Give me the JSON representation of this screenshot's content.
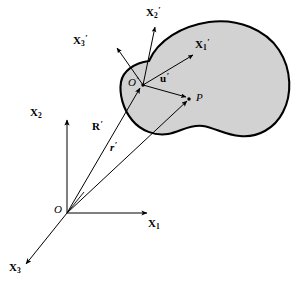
{
  "figure": {
    "type": "vector-diagram",
    "colors": {
      "body_fill": "#d2d2d2",
      "body_outline": "#000000",
      "axis": "#000000",
      "vector": "#000000",
      "background": "#ffffff"
    }
  },
  "labels": {
    "local_axis_1": {
      "symbol": "X",
      "sub": "1",
      "prime": "′"
    },
    "local_axis_2": {
      "symbol": "X",
      "sub": "2",
      "prime": "′"
    },
    "local_axis_3": {
      "symbol": "X",
      "sub": "3",
      "prime": "′"
    },
    "global_axis_1": {
      "symbol": "X",
      "sub": "1",
      "prime": ""
    },
    "global_axis_2": {
      "symbol": "X",
      "sub": "2",
      "prime": ""
    },
    "global_axis_3": {
      "symbol": "X",
      "sub": "3",
      "prime": ""
    },
    "global_origin": {
      "symbol": "O",
      "prime": ""
    },
    "local_origin": {
      "symbol": "O",
      "prime": "′"
    },
    "point": {
      "symbol": "P",
      "prime": ""
    },
    "vector_u": {
      "symbol": "u",
      "prime": "′"
    },
    "vector_R": {
      "symbol": "R",
      "prime": "′"
    },
    "vector_r": {
      "symbol": "r",
      "prime": "′"
    }
  },
  "geometry": {
    "global_origin_xy": [
      67,
      213
    ],
    "local_origin_xy": [
      143,
      85
    ],
    "point_P_xy": [
      190,
      99
    ],
    "axis_X1_end_xy": [
      150,
      213
    ],
    "axis_X2_end_xy": [
      67,
      117
    ],
    "axis_X3_end_xy": [
      22,
      268
    ],
    "local_X1_end_xy": [
      196,
      52
    ],
    "local_X2_end_xy": [
      156,
      23
    ],
    "local_X3_end_xy": [
      113,
      45
    ]
  }
}
